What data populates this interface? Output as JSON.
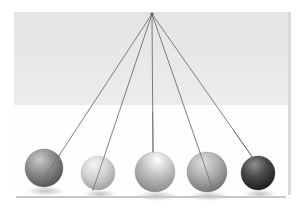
{
  "illustration": {
    "title": "Newton's Cradle",
    "subject": "pendulum-spheres",
    "canvas": {
      "width": 299,
      "height": 212
    },
    "background": {
      "outer_color": "#ffffff",
      "band_color": "#e4e4e4",
      "band_color_bottom": "#ececec",
      "band": {
        "x": 14,
        "y": 12,
        "width": 274,
        "height": 93
      },
      "lower_panel_color": "#fefefe",
      "lower_panel": {
        "x": 14,
        "y": 105,
        "width": 274,
        "height": 88
      },
      "right_edge_color": "#d9d9d9",
      "right_edge": {
        "x": 288,
        "y": 12,
        "width": 3,
        "height": 183
      }
    },
    "baseline": {
      "name": "floor-line",
      "color": "#c8c8c8",
      "x1": 16,
      "y1": 197,
      "x2": 286,
      "y2": 197,
      "thickness": 2
    },
    "pivot": {
      "name": "pivot-point",
      "x": 152,
      "y": 14,
      "color": "#555555",
      "radius": 1.6
    },
    "string": {
      "color": "#6e6e6e",
      "width": 0.9,
      "count": 5
    },
    "shadow": {
      "color": "#9a9a9a",
      "opacity": 0.45
    },
    "spheres": [
      {
        "label": "sphere-1",
        "cx": 44,
        "cy": 168,
        "r": 19,
        "base_color": "#8c8c8c",
        "highlight_color": "#c9c9c9",
        "shade_color": "#4f4f4f",
        "tone": "dark-gray",
        "string_end_x": 39,
        "string_end_y": 186
      },
      {
        "label": "sphere-2",
        "cx": 98,
        "cy": 173,
        "r": 17,
        "base_color": "#d3d3d3",
        "highlight_color": "#f3f3f3",
        "shade_color": "#9b9b9b",
        "tone": "light-gray",
        "string_end_x": 93,
        "string_end_y": 190
      },
      {
        "label": "sphere-3",
        "cx": 155,
        "cy": 172,
        "r": 20,
        "base_color": "#c6c6c6",
        "highlight_color": "#ffffff",
        "shade_color": "#888888",
        "tone": "pale-gray",
        "string_end_x": 153,
        "string_end_y": 152
      },
      {
        "label": "sphere-4",
        "cx": 207,
        "cy": 172,
        "r": 20,
        "base_color": "#b0b0b0",
        "highlight_color": "#dedede",
        "shade_color": "#6f6f6f",
        "tone": "mid-gray",
        "string_end_x": 213,
        "string_end_y": 190
      },
      {
        "label": "sphere-5",
        "cx": 258,
        "cy": 173,
        "r": 17,
        "base_color": "#4a4a4a",
        "highlight_color": "#8f8f8f",
        "shade_color": "#191919",
        "tone": "near-black",
        "string_end_x": 253,
        "string_end_y": 158
      }
    ]
  }
}
